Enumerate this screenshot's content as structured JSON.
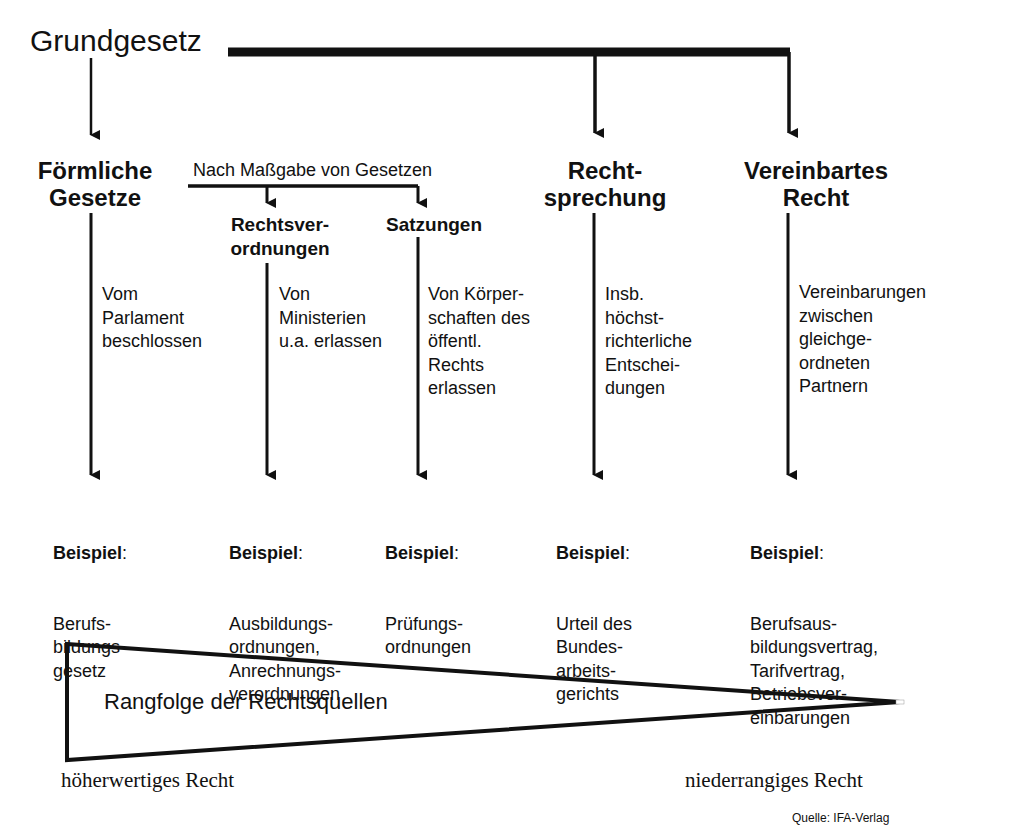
{
  "diagram": {
    "root": "Grundgesetz",
    "mediator_label": "Nach Maßgabe von Gesetzen",
    "categories": [
      {
        "id": "formal_laws",
        "title_line1": "Förmliche",
        "title_line2": "Gesetze",
        "description": "Vom\nParlament\nbeschlossen",
        "example_label": "Beispiel",
        "example": "Berufs-\nbildungs-\ngesetz"
      },
      {
        "id": "ordinances",
        "title_line1": "Rechtsver-",
        "title_line2": "ordnungen",
        "description": "Von\nMinisterien\nu.a. erlassen",
        "example_label": "Beispiel",
        "example": "Ausbildungs-\nordnungen,\nAnrechnungs-\nverordnungen"
      },
      {
        "id": "statutes",
        "title_line1": "Satzungen",
        "description": "Von Körper-\nschaften des\nöffentl.\nRechts\nerlassen",
        "example_label": "Beispiel",
        "example": "Prüfungs-\nordnungen"
      },
      {
        "id": "case_law",
        "title_line1": "Recht-",
        "title_line2": "sprechung",
        "description": "Insb.\nhöchst-\nrichterliche\nEntschei-\ndungen",
        "example_label": "Beispiel",
        "example": "Urteil des\nBundes-\narbeits-\ngerichts"
      },
      {
        "id": "agreed_law",
        "title_line1": "Vereinbartes",
        "title_line2": "Recht",
        "description": "Vereinbarungen\nzwischen\ngleichge-\nordneten\nPartnern",
        "example_label": "Beispiel",
        "example": "Berufsaus-\nbildungsvertrag,\nTarifvertrag,\nBetriebsver-\neinbarungen"
      }
    ],
    "ranking": {
      "label": "Rangfolge der Rechtsquellen",
      "high_end": "höherwertiges Recht",
      "low_end": "niederrangiges Recht"
    },
    "source": "Quelle: IFA-Verlag"
  },
  "colors": {
    "line": "#111111",
    "background": "#ffffff"
  }
}
